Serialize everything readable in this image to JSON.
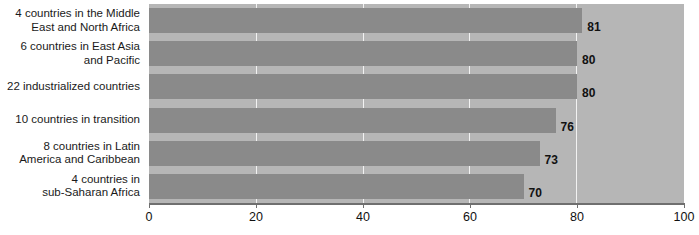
{
  "chart_data": {
    "type": "bar",
    "orientation": "horizontal",
    "title": "",
    "subtitle": "",
    "xlabel": "",
    "ylabel": "",
    "xlim": [
      0,
      100
    ],
    "ylim": null,
    "grid": true,
    "legend": false,
    "legend_position": "none",
    "xticks": [
      "0",
      "20",
      "40",
      "60",
      "80",
      "100"
    ],
    "xtick_values": [
      0,
      20,
      40,
      60,
      80,
      100
    ],
    "categories": [
      "4 countries in the Middle\nEast and North Africa",
      "6 countries in East Asia\nand Pacific",
      "22 industrialized countries",
      "10 countries in transition",
      "8 countries in Latin\nAmerica and Caribbean",
      "4 countries in\nsub-Saharan Africa"
    ],
    "values": [
      81,
      80,
      80,
      76,
      73,
      70
    ],
    "value_labels": [
      "81",
      "80",
      "80",
      "76",
      "73",
      "70"
    ],
    "colors": {
      "bar": "#8a8a8a",
      "plot_background": "#b6b6b6",
      "gridline": "#f2f2f2",
      "axis": "#6f6f6f",
      "text": "#111111",
      "page_background": "#ffffff"
    }
  }
}
